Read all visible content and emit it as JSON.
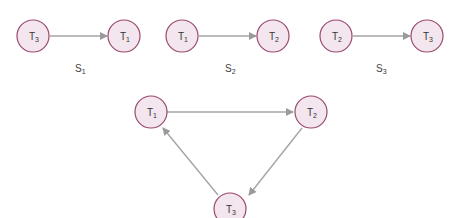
{
  "colors": {
    "node_fill": "#f3e6ee",
    "node_stroke": "#9a4a6e",
    "edge": "#a5a5a5"
  },
  "schedules": [
    {
      "label": "S",
      "label_sub": "1",
      "from": {
        "name": "T",
        "sub": "3"
      },
      "to": {
        "name": "T",
        "sub": "1"
      }
    },
    {
      "label": "S",
      "label_sub": "2",
      "from": {
        "name": "T",
        "sub": "1"
      },
      "to": {
        "name": "T",
        "sub": "2"
      }
    },
    {
      "label": "S",
      "label_sub": "3",
      "from": {
        "name": "T",
        "sub": "2"
      },
      "to": {
        "name": "T",
        "sub": "3"
      }
    }
  ],
  "cycle": {
    "nodes": [
      {
        "name": "T",
        "sub": "1"
      },
      {
        "name": "T",
        "sub": "2"
      },
      {
        "name": "T",
        "sub": "3"
      }
    ],
    "edges": [
      {
        "from": "T1",
        "to": "T2"
      },
      {
        "from": "T2",
        "to": "T3"
      },
      {
        "from": "T3",
        "to": "T1"
      }
    ]
  }
}
